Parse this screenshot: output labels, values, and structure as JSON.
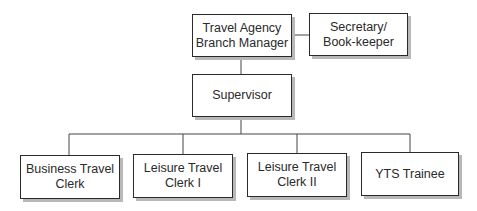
{
  "chart": {
    "type": "org-chart",
    "nodes": {
      "manager": "Travel Agency\nBranch Manager",
      "secretary": "Secretary/\nBook-keeper",
      "supervisor": "Supervisor",
      "business_clerk": "Business Travel\nClerk",
      "leisure_clerk_1": "Leisure Travel\nClerk I",
      "leisure_clerk_2": "Leisure Travel\nClerk II",
      "yts_trainee": "YTS Trainee"
    },
    "relationships": [
      {
        "from": "manager",
        "to": "secretary",
        "type": "staff"
      },
      {
        "from": "manager",
        "to": "supervisor",
        "type": "line"
      },
      {
        "from": "supervisor",
        "to": "business_clerk",
        "type": "line"
      },
      {
        "from": "supervisor",
        "to": "leisure_clerk_1",
        "type": "line"
      },
      {
        "from": "supervisor",
        "to": "leisure_clerk_2",
        "type": "line"
      },
      {
        "from": "supervisor",
        "to": "yts_trainee",
        "type": "line"
      }
    ]
  }
}
